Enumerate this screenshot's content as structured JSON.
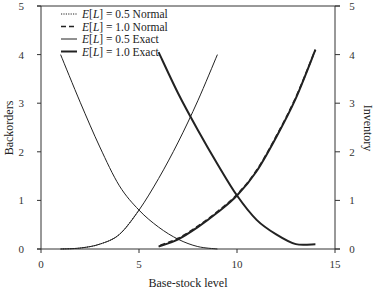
{
  "chart_data": {
    "type": "line",
    "title": "",
    "xlabel": "Base-stock level",
    "ylabel_left": "Backorders",
    "ylabel_right": "Inventory",
    "xlim": [
      0,
      15
    ],
    "ylim_left": [
      0,
      5
    ],
    "ylim_right": [
      0,
      5
    ],
    "x_ticks": [
      "0",
      "5",
      "10",
      "15"
    ],
    "y_ticks_left": [
      "0",
      "1",
      "2",
      "3",
      "4",
      "5"
    ],
    "y_ticks_right": [
      "0",
      "1",
      "2",
      "3",
      "4",
      "5"
    ],
    "grid": false,
    "legend_position": "upper-left",
    "legend": [
      {
        "label_prefix": "E[L]",
        "label_suffix": " = 0.5 Normal",
        "style": "dotted",
        "width": 1
      },
      {
        "label_prefix": "E[L]",
        "label_suffix": " = 1.0 Normal",
        "style": "dashed",
        "width": 1.6
      },
      {
        "label_prefix": "E[L]",
        "label_suffix": " = 0.5 Exact",
        "style": "solid",
        "width": 1
      },
      {
        "label_prefix": "E[L]",
        "label_suffix": " = 1.0 Exact",
        "style": "solid",
        "width": 2
      }
    ],
    "series": [
      {
        "name": "E[L] = 0.5 Exact – Backorders",
        "axis": "left",
        "style": "solid",
        "width": 1,
        "x": [
          1,
          2,
          3,
          4,
          5,
          6,
          7,
          8,
          9
        ],
        "values": [
          4.0,
          3.02,
          2.1,
          1.3,
          0.8,
          0.45,
          0.2,
          0.05,
          0.0
        ]
      },
      {
        "name": "E[L] = 0.5 Exact – Inventory",
        "axis": "right",
        "style": "solid",
        "width": 1,
        "x": [
          1,
          2,
          3,
          4,
          5,
          6,
          7,
          8,
          9
        ],
        "values": [
          0.0,
          0.02,
          0.1,
          0.3,
          0.8,
          1.45,
          2.2,
          3.05,
          4.0
        ]
      },
      {
        "name": "E[L] = 0.5 Normal – Inventory",
        "axis": "right",
        "style": "dotted",
        "width": 1,
        "x": [
          1,
          2,
          3,
          4,
          5
        ],
        "values": [
          0.0,
          0.02,
          0.1,
          0.3,
          0.8
        ]
      },
      {
        "name": "E[L] = 1.0 Exact – Backorders",
        "axis": "left",
        "style": "solid",
        "width": 2,
        "x": [
          6,
          7,
          8,
          9,
          10,
          11,
          12,
          13,
          14
        ],
        "values": [
          4.05,
          3.2,
          2.45,
          1.75,
          1.1,
          0.6,
          0.3,
          0.1,
          0.1
        ]
      },
      {
        "name": "E[L] = 1.0 Exact – Inventory",
        "axis": "right",
        "style": "solid",
        "width": 2,
        "x": [
          6,
          7,
          8,
          9,
          10,
          11,
          12,
          13,
          14
        ],
        "values": [
          0.05,
          0.2,
          0.45,
          0.75,
          1.1,
          1.6,
          2.3,
          3.1,
          4.1
        ]
      },
      {
        "name": "E[L] = 1.0 Normal – Inventory",
        "axis": "right",
        "style": "dashed",
        "width": 1.6,
        "x": [
          6.1,
          7,
          8,
          9,
          10,
          11,
          12,
          13,
          14
        ],
        "values": [
          0.08,
          0.22,
          0.47,
          0.77,
          1.12,
          1.62,
          2.32,
          3.12,
          4.1
        ]
      }
    ]
  }
}
